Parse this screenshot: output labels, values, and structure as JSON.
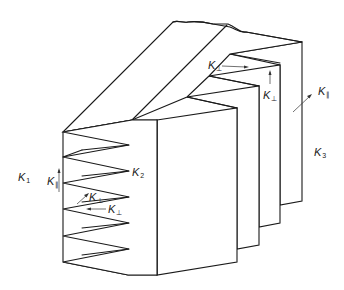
{
  "figure": {
    "labels": {
      "k1": {
        "main": "K",
        "sub": "1"
      },
      "k2": {
        "main": "K",
        "sub": "2"
      },
      "k3": {
        "main": "K",
        "sub": "3"
      },
      "k_par_left": {
        "main": "K",
        "sub": "∥"
      },
      "k_perp_left_upper": {
        "main": "K",
        "sub": "⊥"
      },
      "k_perp_left_lower": {
        "main": "K",
        "sub": "⊥"
      },
      "k_perp_top": {
        "main": "K",
        "sub": "⊥"
      },
      "k_perp_top_vertical": {
        "main": "K",
        "sub": "⊥"
      },
      "k_par_right": {
        "main": "K",
        "sub": "∥"
      }
    },
    "colors": {
      "line": "#1a1a1a",
      "background": "#ffffff"
    }
  }
}
